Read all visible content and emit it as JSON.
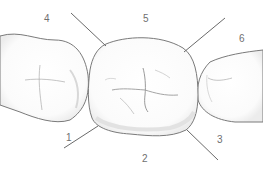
{
  "diagram": {
    "colors": {
      "outline": "#7a7a7a",
      "leader": "#6a6a6a",
      "fissure": "#9a9a9a",
      "shade": "#e9e9e9",
      "label": "#6f6f6f"
    },
    "labels": [
      {
        "id": "1",
        "text": "1",
        "x": 66,
        "y": 133
      },
      {
        "id": "2",
        "text": "2",
        "x": 142,
        "y": 154
      },
      {
        "id": "3",
        "text": "3",
        "x": 217,
        "y": 135
      },
      {
        "id": "4",
        "text": "4",
        "x": 44,
        "y": 14
      },
      {
        "id": "5",
        "text": "5",
        "x": 143,
        "y": 14
      },
      {
        "id": "6",
        "text": "6",
        "x": 239,
        "y": 34
      }
    ]
  }
}
